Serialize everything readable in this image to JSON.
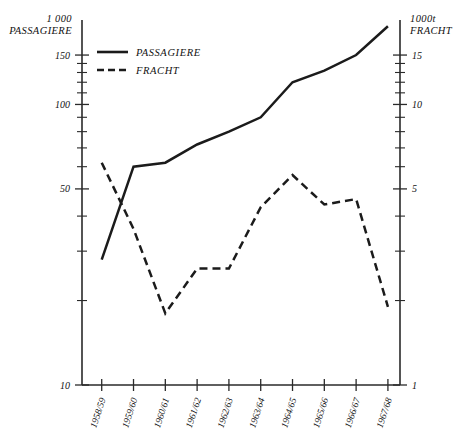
{
  "chart_data": {
    "type": "line",
    "title": "",
    "xlabel": "",
    "ylabel": "1 000 PASSAGIERE",
    "y2label": "1000t FRACHT",
    "y_scale": "log",
    "ylim": [
      10,
      200
    ],
    "y2lim": [
      1,
      20
    ],
    "grid": false,
    "legend_position": "top-left-inside",
    "categories": [
      "1958/59",
      "1959/60",
      "1960/61",
      "1961/62",
      "1962/63",
      "1963/64",
      "1964/65",
      "1965/66",
      "1966/67",
      "1967/68"
    ],
    "series": [
      {
        "name": "PASSAGIERE",
        "style": "solid",
        "axis": "left",
        "unit": "1 000 Passagiere",
        "values": [
          28,
          60,
          62,
          72,
          80,
          90,
          120,
          132,
          150,
          190
        ]
      },
      {
        "name": "FRACHT",
        "style": "dashed",
        "axis": "right",
        "unit": "1000 t Fracht",
        "values": [
          6.2,
          3.6,
          1.8,
          2.6,
          2.6,
          4.3,
          5.6,
          4.4,
          4.6,
          1.9
        ]
      }
    ]
  },
  "axes": {
    "left": {
      "header_line1": "1 000",
      "header_line2": "PASSAGIERE",
      "ticks": [
        {
          "value": 150,
          "label": "150",
          "major": true
        },
        {
          "value": 140,
          "label": "",
          "major": false
        },
        {
          "value": 130,
          "label": "",
          "major": false
        },
        {
          "value": 120,
          "label": "",
          "major": false
        },
        {
          "value": 110,
          "label": "",
          "major": false
        },
        {
          "value": 100,
          "label": "100",
          "major": true
        },
        {
          "value": 90,
          "label": "",
          "major": false
        },
        {
          "value": 80,
          "label": "",
          "major": false
        },
        {
          "value": 70,
          "label": "",
          "major": false
        },
        {
          "value": 60,
          "label": "",
          "major": false
        },
        {
          "value": 50,
          "label": "50",
          "major": true
        },
        {
          "value": 40,
          "label": "",
          "major": false
        },
        {
          "value": 30,
          "label": "",
          "major": false
        },
        {
          "value": 20,
          "label": "",
          "major": false
        },
        {
          "value": 10,
          "label": "10",
          "major": true
        }
      ]
    },
    "right": {
      "header_line1": "1000t",
      "header_line2": "FRACHT",
      "ticks": [
        {
          "value": 15,
          "label": "15",
          "major": true
        },
        {
          "value": 14,
          "label": "",
          "major": false
        },
        {
          "value": 13,
          "label": "",
          "major": false
        },
        {
          "value": 12,
          "label": "",
          "major": false
        },
        {
          "value": 11,
          "label": "",
          "major": false
        },
        {
          "value": 10,
          "label": "10",
          "major": true
        },
        {
          "value": 9,
          "label": "",
          "major": false
        },
        {
          "value": 8,
          "label": "",
          "major": false
        },
        {
          "value": 7,
          "label": "",
          "major": false
        },
        {
          "value": 6,
          "label": "",
          "major": false
        },
        {
          "value": 5,
          "label": "5",
          "major": true
        },
        {
          "value": 4,
          "label": "",
          "major": false
        },
        {
          "value": 3,
          "label": "",
          "major": false
        },
        {
          "value": 2,
          "label": "",
          "major": false
        },
        {
          "value": 1,
          "label": "1",
          "major": true
        }
      ]
    }
  },
  "legend": {
    "items": [
      {
        "label": "PASSAGIERE",
        "style": "solid"
      },
      {
        "label": "FRACHT",
        "style": "dashed"
      }
    ]
  }
}
